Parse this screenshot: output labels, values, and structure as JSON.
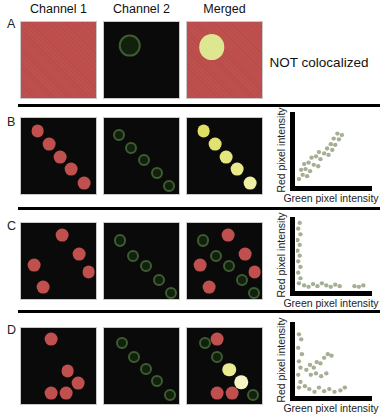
{
  "columns": [
    "Channel 1",
    "Channel 2",
    "Merged"
  ],
  "axis": {
    "x": "Green pixel intensity",
    "y": "Red pixel intensity"
  },
  "colors": {
    "red": "#c0504d",
    "panel_black": "#0a0a0a",
    "ring_stroke": "#3d5c30",
    "ring_fill": "#12200e",
    "scatter_dot": "#a5af93",
    "divider": "#000000",
    "pale_overlap_circle": "#dde792"
  },
  "rows": [
    {
      "label": "A",
      "annotation": "NOT colocalized",
      "panels": [
        {
          "variant": "red",
          "items": []
        },
        {
          "variant": "black",
          "items": [
            {
              "t": "ring",
              "x": 34,
              "y": 31,
              "d": 30
            }
          ]
        },
        {
          "variant": "red",
          "items": [
            {
              "t": "dot",
              "x": 33,
              "y": 33,
              "d": 34,
              "c": "#dde792"
            }
          ]
        }
      ]
    },
    {
      "label": "B",
      "panels": [
        {
          "variant": "black",
          "items": [
            {
              "t": "dot",
              "x": 22,
              "y": 17,
              "d": 17
            },
            {
              "t": "dot",
              "x": 37,
              "y": 34,
              "d": 17
            },
            {
              "t": "dot",
              "x": 52,
              "y": 51,
              "d": 17
            },
            {
              "t": "dot",
              "x": 67,
              "y": 67,
              "d": 17
            },
            {
              "t": "dot",
              "x": 84,
              "y": 85,
              "d": 17
            }
          ]
        },
        {
          "variant": "black",
          "items": [
            {
              "t": "ring",
              "x": 20,
              "y": 22,
              "d": 16
            },
            {
              "t": "ring",
              "x": 36,
              "y": 39,
              "d": 16
            },
            {
              "t": "ring",
              "x": 53,
              "y": 55,
              "d": 16
            },
            {
              "t": "ring",
              "x": 70,
              "y": 72,
              "d": 16
            },
            {
              "t": "ring",
              "x": 87,
              "y": 89,
              "d": 16
            }
          ]
        },
        {
          "variant": "black",
          "items": [
            {
              "t": "dot",
              "x": 22,
              "y": 17,
              "d": 17,
              "c": "#dfdf66"
            },
            {
              "t": "dot",
              "x": 37,
              "y": 34,
              "d": 17,
              "c": "#e2e272"
            },
            {
              "t": "dot",
              "x": 52,
              "y": 51,
              "d": 17,
              "c": "#e6e67e"
            },
            {
              "t": "dot",
              "x": 67,
              "y": 67,
              "d": 17,
              "c": "#eaea8c"
            },
            {
              "t": "dot",
              "x": 84,
              "y": 85,
              "d": 17,
              "c": "#f0f0a4"
            }
          ]
        }
      ]
    },
    {
      "label": "C",
      "panels": [
        {
          "variant": "black",
          "items": [
            {
              "t": "dot",
              "x": 55,
              "y": 16,
              "d": 17
            },
            {
              "t": "dot",
              "x": 77,
              "y": 41,
              "d": 17
            },
            {
              "t": "dot",
              "x": 17,
              "y": 55,
              "d": 17
            },
            {
              "t": "dot",
              "x": 90,
              "y": 64,
              "d": 17
            },
            {
              "t": "dot",
              "x": 29,
              "y": 84,
              "d": 17
            }
          ]
        },
        {
          "variant": "black",
          "items": [
            {
              "t": "ring",
              "x": 21,
              "y": 23,
              "d": 16
            },
            {
              "t": "ring",
              "x": 38,
              "y": 43,
              "d": 16
            },
            {
              "t": "ring",
              "x": 56,
              "y": 57,
              "d": 16
            },
            {
              "t": "ring",
              "x": 73,
              "y": 75,
              "d": 16
            },
            {
              "t": "ring",
              "x": 89,
              "y": 92,
              "d": 16
            }
          ]
        },
        {
          "variant": "black",
          "items": [
            {
              "t": "ring",
              "x": 21,
              "y": 23,
              "d": 16
            },
            {
              "t": "ring",
              "x": 38,
              "y": 43,
              "d": 16
            },
            {
              "t": "ring",
              "x": 56,
              "y": 57,
              "d": 16
            },
            {
              "t": "ring",
              "x": 73,
              "y": 75,
              "d": 16
            },
            {
              "t": "ring",
              "x": 89,
              "y": 92,
              "d": 16
            },
            {
              "t": "dot",
              "x": 55,
              "y": 16,
              "d": 17
            },
            {
              "t": "dot",
              "x": 77,
              "y": 41,
              "d": 17
            },
            {
              "t": "dot",
              "x": 17,
              "y": 55,
              "d": 17
            },
            {
              "t": "dot",
              "x": 90,
              "y": 64,
              "d": 17
            },
            {
              "t": "dot",
              "x": 29,
              "y": 84,
              "d": 17
            }
          ]
        }
      ]
    },
    {
      "label": "D",
      "panels": [
        {
          "variant": "black",
          "items": [
            {
              "t": "dot",
              "x": 40,
              "y": 14,
              "d": 17
            },
            {
              "t": "dot",
              "x": 62,
              "y": 57,
              "d": 17
            },
            {
              "t": "dot",
              "x": 76,
              "y": 72,
              "d": 17
            },
            {
              "t": "dot",
              "x": 40,
              "y": 86,
              "d": 17
            },
            {
              "t": "dot",
              "x": 60,
              "y": 86,
              "d": 17
            }
          ]
        },
        {
          "variant": "black",
          "items": [
            {
              "t": "ring",
              "x": 24,
              "y": 20,
              "d": 16
            },
            {
              "t": "ring",
              "x": 40,
              "y": 38,
              "d": 16
            },
            {
              "t": "ring",
              "x": 56,
              "y": 54,
              "d": 16
            },
            {
              "t": "ring",
              "x": 71,
              "y": 70,
              "d": 16
            },
            {
              "t": "ring",
              "x": 88,
              "y": 88,
              "d": 16
            }
          ]
        },
        {
          "variant": "black",
          "items": [
            {
              "t": "ring",
              "x": 24,
              "y": 20,
              "d": 16
            },
            {
              "t": "ring",
              "x": 40,
              "y": 38,
              "d": 16
            },
            {
              "t": "ring",
              "x": 88,
              "y": 88,
              "d": 16
            },
            {
              "t": "dot",
              "x": 40,
              "y": 14,
              "d": 17
            },
            {
              "t": "dot",
              "x": 56,
              "y": 55,
              "d": 18,
              "c": "#eaea90"
            },
            {
              "t": "dot",
              "x": 72,
              "y": 71,
              "d": 18,
              "c": "#f5f5c6"
            },
            {
              "t": "dot",
              "x": 40,
              "y": 86,
              "d": 17
            },
            {
              "t": "dot",
              "x": 60,
              "y": 86,
              "d": 17
            }
          ]
        }
      ]
    }
  ],
  "chart_data": [
    {
      "type": "scatter",
      "row": "B",
      "xlabel": "Green pixel intensity",
      "ylabel": "Red pixel intensity",
      "xlim": [
        0,
        100
      ],
      "ylim": [
        0,
        100
      ],
      "grid": false,
      "ticks": "none",
      "pattern": "positive linear correlation (signals colocalized)",
      "points": [
        [
          4,
          7
        ],
        [
          9,
          13
        ],
        [
          15,
          11
        ],
        [
          7,
          20
        ],
        [
          13,
          21
        ],
        [
          19,
          18
        ],
        [
          11,
          28
        ],
        [
          17,
          30
        ],
        [
          24,
          27
        ],
        [
          30,
          25
        ],
        [
          21,
          37
        ],
        [
          27,
          39
        ],
        [
          33,
          35
        ],
        [
          31,
          45
        ],
        [
          38,
          43
        ],
        [
          44,
          41
        ],
        [
          42,
          50
        ],
        [
          49,
          48
        ],
        [
          47,
          56
        ],
        [
          53,
          55
        ],
        [
          51,
          64
        ],
        [
          58,
          63
        ],
        [
          56,
          71
        ],
        [
          62,
          69
        ]
      ]
    },
    {
      "type": "scatter",
      "row": "C",
      "xlabel": "Green pixel intensity",
      "ylabel": "Red pixel intensity",
      "xlim": [
        0,
        100
      ],
      "ylim": [
        0,
        100
      ],
      "grid": false,
      "ticks": "none",
      "pattern": "points hug both axes (signals mutually exclusive)",
      "points": [
        [
          5,
          93
        ],
        [
          3,
          85
        ],
        [
          6,
          77
        ],
        [
          2,
          69
        ],
        [
          5,
          62
        ],
        [
          2,
          54
        ],
        [
          5,
          47
        ],
        [
          3,
          39
        ],
        [
          6,
          31
        ],
        [
          3,
          23
        ],
        [
          6,
          15
        ],
        [
          4,
          8
        ],
        [
          11,
          5
        ],
        [
          17,
          3
        ],
        [
          23,
          7
        ],
        [
          29,
          4
        ],
        [
          35,
          8
        ],
        [
          41,
          5
        ],
        [
          47,
          3
        ],
        [
          53,
          6
        ],
        [
          59,
          4
        ],
        [
          79,
          4
        ],
        [
          85,
          3
        ],
        [
          91,
          5
        ]
      ]
    },
    {
      "type": "scatter",
      "row": "D",
      "xlabel": "Green pixel intensity",
      "ylabel": "Red pixel intensity",
      "xlim": [
        0,
        100
      ],
      "ylim": [
        0,
        100
      ],
      "grid": false,
      "ticks": "none",
      "pattern": "mixed: axis-hugging points plus central diagonal cluster (partial colocalization)",
      "points": [
        [
          4,
          84
        ],
        [
          7,
          77
        ],
        [
          3,
          65
        ],
        [
          8,
          56
        ],
        [
          4,
          46
        ],
        [
          6,
          37
        ],
        [
          3,
          27
        ],
        [
          6,
          17
        ],
        [
          4,
          9
        ],
        [
          14,
          34
        ],
        [
          19,
          41
        ],
        [
          24,
          37
        ],
        [
          28,
          45
        ],
        [
          33,
          43
        ],
        [
          38,
          51
        ],
        [
          43,
          56
        ],
        [
          48,
          54
        ],
        [
          20,
          27
        ],
        [
          27,
          29
        ],
        [
          34,
          25
        ],
        [
          41,
          29
        ],
        [
          12,
          11
        ],
        [
          18,
          7
        ],
        [
          25,
          3
        ],
        [
          31,
          9
        ],
        [
          38,
          4
        ],
        [
          45,
          7
        ],
        [
          52,
          3
        ],
        [
          60,
          5
        ],
        [
          66,
          9
        ]
      ]
    }
  ]
}
